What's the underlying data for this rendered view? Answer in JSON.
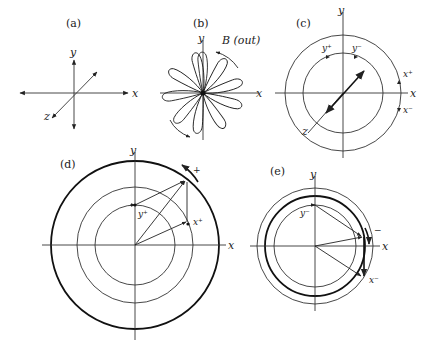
{
  "figure": {
    "panels": [
      {
        "id": "a",
        "label": "(a)",
        "axes": {
          "x": "x",
          "y": "y",
          "z": "z"
        }
      },
      {
        "id": "b",
        "label": "(b)",
        "axes": {
          "x": "x",
          "y": "y"
        },
        "field_label": "B (out)"
      },
      {
        "id": "c",
        "label": "(c)",
        "axes": {
          "x": "x",
          "y": "y",
          "z": "z"
        },
        "states": {
          "y_plus": "y⁺",
          "y_minus": "y⁻",
          "x_plus": "x⁺",
          "x_minus": "x⁻"
        }
      },
      {
        "id": "d",
        "label": "(d)",
        "axes": {
          "x": "x",
          "y": "y"
        },
        "states": {
          "y_plus": "y⁺",
          "x_plus": "x⁺"
        },
        "rotation_sign": "+"
      },
      {
        "id": "e",
        "label": "(e)",
        "axes": {
          "x": "x",
          "y": "y"
        },
        "states": {
          "y_minus": "y⁻",
          "x_minus": "x⁻"
        },
        "rotation_sign": "−"
      }
    ]
  }
}
